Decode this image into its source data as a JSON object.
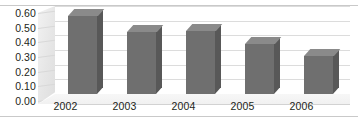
{
  "chart_data": {
    "type": "bar",
    "title": "",
    "subtitle": "",
    "xlabel": "",
    "ylabel": "",
    "categories": [
      "2002",
      "2003",
      "2004",
      "2005",
      "2006"
    ],
    "values": [
      0.53,
      0.42,
      0.43,
      0.34,
      0.26
    ],
    "series": [
      {
        "name": "",
        "values": [
          0.53,
          0.42,
          0.43,
          0.34,
          0.26
        ]
      }
    ],
    "ylim": [
      0.0,
      0.6
    ],
    "ytick_labels": [
      "0.60",
      "0.50",
      "0.40",
      "0.30",
      "0.20",
      "0.10",
      "0.00"
    ],
    "ytick_values": [
      0.6,
      0.5,
      0.4,
      0.3,
      0.2,
      0.1,
      0.0
    ],
    "grid": true,
    "legend": false,
    "legend_position": "none",
    "style": "3d-column",
    "annotations": [],
    "colors": {
      "bar_front": "#6f6f6f",
      "bar_top": "#8a8a8a",
      "bar_side": "#585858",
      "gridline": "#dcdcdc",
      "frame": "#c9c9c9",
      "plot_background": "#ffffff",
      "wall": "#ebebeb",
      "text": "#231f20"
    }
  }
}
